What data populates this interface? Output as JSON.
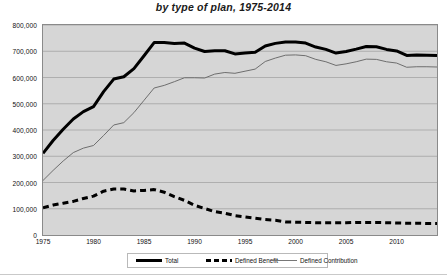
{
  "chart_data": {
    "type": "line",
    "title": "by type of plan, 1975-2014",
    "xlabel": "",
    "ylabel": "",
    "xlim": [
      1975,
      2014
    ],
    "ylim": [
      0,
      800000
    ],
    "grid": true,
    "grid_axis": "y",
    "legend_position": "bottom",
    "plot_background": "#d6d6d6",
    "x": [
      1975,
      1976,
      1977,
      1978,
      1979,
      1980,
      1981,
      1982,
      1983,
      1984,
      1985,
      1986,
      1987,
      1988,
      1989,
      1990,
      1991,
      1992,
      1993,
      1994,
      1995,
      1996,
      1997,
      1998,
      1999,
      2000,
      2001,
      2002,
      2003,
      2004,
      2005,
      2006,
      2007,
      2008,
      2009,
      2010,
      2011,
      2012,
      2013,
      2014
    ],
    "xticks": [
      1975,
      1980,
      1985,
      1990,
      1995,
      2000,
      2005,
      2010
    ],
    "yticks": [
      0,
      100000,
      200000,
      300000,
      400000,
      500000,
      600000,
      700000,
      800000
    ],
    "ytick_labels": [
      "0",
      "100,000",
      "200,000",
      "300,000",
      "400,000",
      "500,000",
      "600,000",
      "700,000",
      "800,000"
    ],
    "series": [
      {
        "name": "Total",
        "style": "thick-solid",
        "color": "#000000",
        "width": 3.0,
        "values": [
          311094,
          360000,
          403000,
          442000,
          470000,
          489000,
          546000,
          594000,
          603000,
          634000,
          683000,
          733000,
          733000,
          730000,
          731000,
          712000,
          699000,
          702000,
          702000,
          690000,
          693000,
          696000,
          720000,
          730000,
          735000,
          735000,
          731000,
          716000,
          707000,
          693000,
          699000,
          708000,
          718000,
          717000,
          707000,
          701000,
          684000,
          686000,
          685000,
          684000
        ]
      },
      {
        "name": "Defined Benefit",
        "style": "dashed",
        "color": "#000000",
        "width": 3.0,
        "values": [
          103346,
          114000,
          121000,
          128000,
          139000,
          148000,
          167000,
          175000,
          175000,
          168000,
          170000,
          173000,
          163000,
          146000,
          132000,
          113000,
          101000,
          89000,
          83000,
          74000,
          69000,
          64000,
          59000,
          56000,
          50000,
          49000,
          48000,
          47000,
          47000,
          47000,
          47000,
          48000,
          48000,
          48000,
          47000,
          46000,
          45000,
          45000,
          44000,
          44000
        ]
      },
      {
        "name": "Defined Contribution",
        "style": "thin-solid",
        "color": "#6e6e6e",
        "width": 1.0,
        "values": [
          207748,
          246000,
          282000,
          314000,
          331000,
          341000,
          379000,
          419000,
          428000,
          466000,
          513000,
          560000,
          570000,
          584000,
          599000,
          599000,
          598000,
          613000,
          619000,
          616000,
          624000,
          632000,
          661000,
          674000,
          685000,
          686000,
          683000,
          669000,
          660000,
          646000,
          652000,
          660000,
          670000,
          669000,
          660000,
          655000,
          639000,
          641000,
          641000,
          640000
        ]
      }
    ]
  },
  "legend": {
    "items": [
      {
        "label": "Total",
        "key": "total"
      },
      {
        "label": "Defined Benefit",
        "key": "db"
      },
      {
        "label": "Defined Contribution",
        "key": "dc"
      }
    ]
  }
}
